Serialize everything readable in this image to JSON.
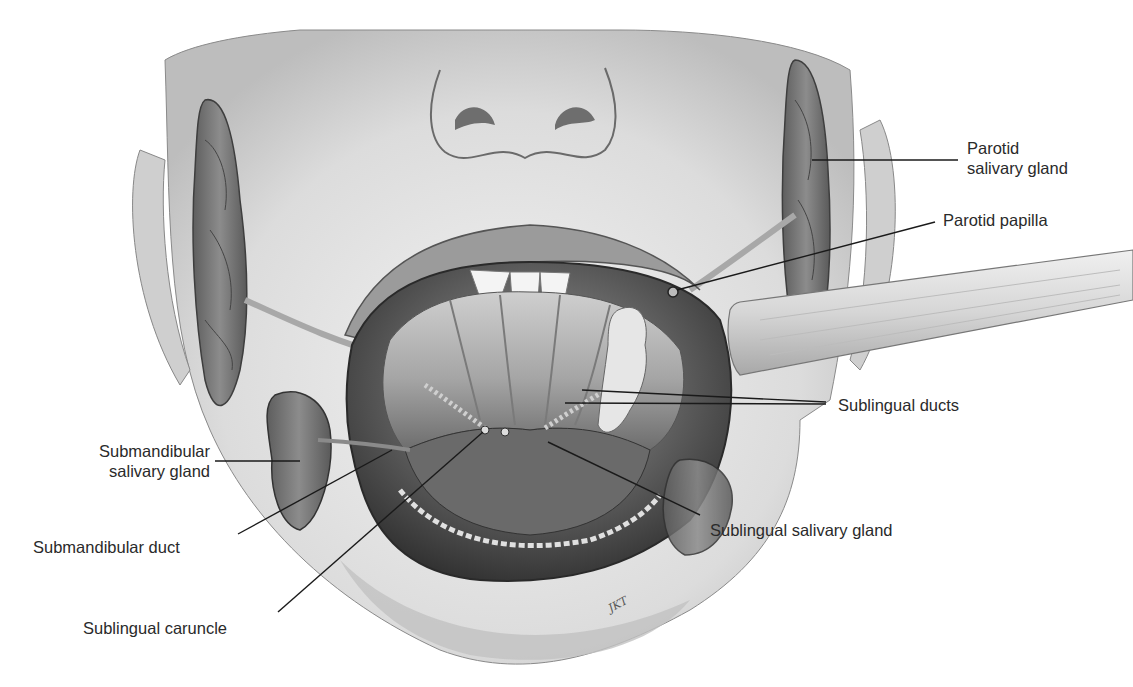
{
  "figure": {
    "style": "grayscale medical illustration",
    "colors": {
      "background": "#ffffff",
      "label_text": "#2a2a2a",
      "leader_line": "#1a1a1a",
      "skin": "#d9d9d9",
      "gland": "#7a7a7a",
      "mouth_cavity": "#3a3a3a"
    },
    "labels": [
      {
        "id": "parotid-gland",
        "line1": "Parotid",
        "line2": "salivary gland"
      },
      {
        "id": "parotid-papilla",
        "line1": "Parotid papilla"
      },
      {
        "id": "sublingual-ducts",
        "line1": "Sublingual ducts"
      },
      {
        "id": "submandibular-gland",
        "line1": "Submandibular",
        "line2": "salivary gland"
      },
      {
        "id": "submandibular-duct",
        "line1": "Submandibular duct"
      },
      {
        "id": "sublingual-gland",
        "line1": "Sublingual salivary gland"
      },
      {
        "id": "sublingual-caruncle",
        "line1": "Sublingual caruncle"
      }
    ],
    "signature": "JKT"
  }
}
